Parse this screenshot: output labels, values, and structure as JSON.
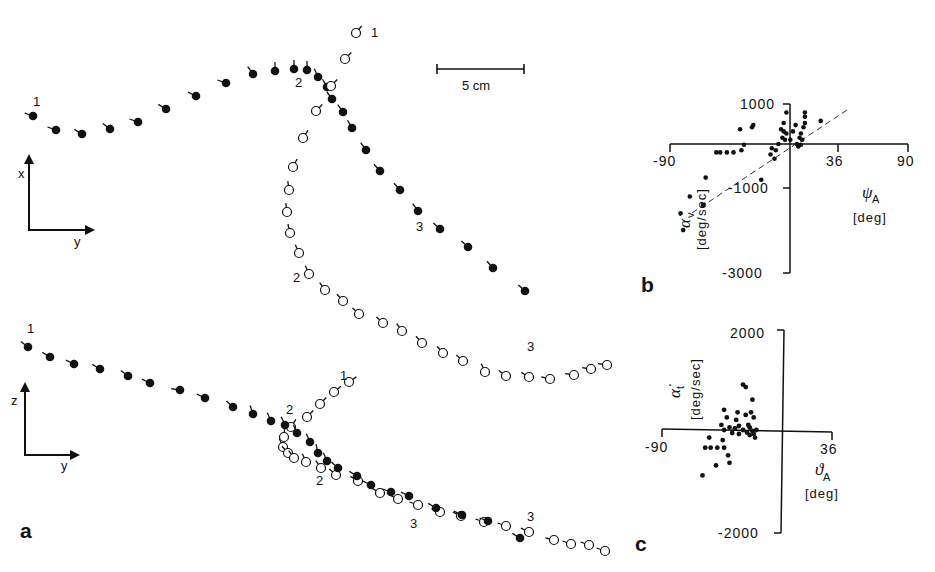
{
  "figure": {
    "panels": {
      "a": "a",
      "b": "b",
      "c": "c"
    },
    "scale_bar": {
      "label": "5 cm",
      "x1": 437,
      "x2": 524,
      "y": 69
    },
    "top_view": {
      "axes": {
        "vertical": "x",
        "horizontal": "y"
      },
      "filled_track": {
        "labels": [
          {
            "text": "1",
            "x": 33,
            "y": 106
          },
          {
            "text": "2",
            "x": 295,
            "y": 87
          },
          {
            "text": "3",
            "x": 416,
            "y": 231
          }
        ],
        "points": [
          [
            33,
            116,
            -2.8
          ],
          [
            56,
            130,
            -2.8
          ],
          [
            82,
            134,
            -2.6
          ],
          [
            110,
            129,
            -2.5
          ],
          [
            138,
            122,
            -2.8
          ],
          [
            166,
            109,
            -2.6
          ],
          [
            196,
            96,
            -2.7
          ],
          [
            226,
            83,
            -2.8
          ],
          [
            253,
            74,
            -2.2
          ],
          [
            275,
            71,
            -1.57
          ],
          [
            294,
            69,
            -1.57
          ],
          [
            307,
            70,
            -1.57
          ],
          [
            318,
            77,
            -2.0
          ],
          [
            327,
            87,
            -2.1
          ],
          [
            332,
            99,
            -2.2
          ],
          [
            343,
            112,
            -2.2
          ],
          [
            352,
            128,
            -2.1
          ],
          [
            366,
            150,
            -2.2
          ],
          [
            380,
            171,
            -2.3
          ],
          [
            400,
            190,
            -2.3
          ],
          [
            418,
            211,
            -2.2
          ],
          [
            440,
            229,
            -2.4
          ],
          [
            468,
            247,
            -2.4
          ],
          [
            493,
            268,
            -2.3
          ],
          [
            525,
            291,
            -2.4
          ]
        ]
      },
      "open_track": {
        "labels": [
          {
            "text": "1",
            "x": 371,
            "y": 37
          },
          {
            "text": "2",
            "x": 293,
            "y": 282
          },
          {
            "text": "3",
            "x": 527,
            "y": 351
          }
        ],
        "points": [
          [
            356,
            33,
            -0.9
          ],
          [
            345,
            59,
            -0.8
          ],
          [
            331,
            86,
            -0.8
          ],
          [
            316,
            111,
            -0.8
          ],
          [
            303,
            138,
            -1.0
          ],
          [
            293,
            167,
            -1.1
          ],
          [
            289,
            190,
            -1.7
          ],
          [
            287,
            212,
            -1.7
          ],
          [
            290,
            233,
            -1.8
          ],
          [
            299,
            253,
            -2.0
          ],
          [
            309,
            274,
            -2.0
          ],
          [
            325,
            290,
            -2.2
          ],
          [
            343,
            301,
            -2.3
          ],
          [
            359,
            314,
            -2.4
          ],
          [
            383,
            323,
            -2.4
          ],
          [
            402,
            331,
            -2.2
          ],
          [
            422,
            343,
            -2.3
          ],
          [
            443,
            353,
            -2.3
          ],
          [
            463,
            361,
            -2.4
          ],
          [
            485,
            372,
            -2.0
          ],
          [
            506,
            376,
            -2.5
          ],
          [
            529,
            377,
            -2.6
          ],
          [
            550,
            379,
            -2.9
          ],
          [
            574,
            375,
            -3.0
          ],
          [
            591,
            369,
            -3.0
          ],
          [
            607,
            365,
            -3.0
          ]
        ]
      }
    },
    "side_view": {
      "axes": {
        "vertical": "z",
        "horizontal": "y"
      },
      "filled_track": {
        "labels": [
          {
            "text": "1",
            "x": 27,
            "y": 333
          },
          {
            "text": "2",
            "x": 286,
            "y": 414
          },
          {
            "text": "3",
            "x": 410,
            "y": 528
          }
        ],
        "points": [
          [
            28,
            347,
            -2.5
          ],
          [
            50,
            357,
            -2.6
          ],
          [
            74,
            364,
            -2.7
          ],
          [
            100,
            369,
            -2.6
          ],
          [
            128,
            376,
            -2.5
          ],
          [
            150,
            383,
            -2.7
          ],
          [
            180,
            390,
            -3.0
          ],
          [
            205,
            398,
            -2.7
          ],
          [
            233,
            407,
            -2.4
          ],
          [
            253,
            414,
            -1.9
          ],
          [
            271,
            421,
            -2.0
          ],
          [
            285,
            425,
            -2.0
          ],
          [
            297,
            433,
            -2.0
          ],
          [
            310,
            442,
            -2.0
          ],
          [
            318,
            453,
            -1.8
          ],
          [
            327,
            461,
            -2.0
          ],
          [
            338,
            468,
            -2.4
          ],
          [
            357,
            476,
            -2.6
          ],
          [
            371,
            485,
            -2.7
          ],
          [
            391,
            492,
            -2.8
          ],
          [
            409,
            496,
            -2.7
          ],
          [
            436,
            508,
            -2.6
          ],
          [
            462,
            515,
            -2.7
          ],
          [
            488,
            521,
            -2.8
          ],
          [
            520,
            538,
            -2.6
          ]
        ]
      },
      "open_track": {
        "labels": [
          {
            "text": "1",
            "x": 340,
            "y": 380
          },
          {
            "text": "2",
            "x": 316,
            "y": 485
          },
          {
            "text": "3",
            "x": 527,
            "y": 521
          }
        ],
        "points": [
          [
            349,
            382,
            -0.6
          ],
          [
            334,
            392,
            -0.7
          ],
          [
            320,
            404,
            -0.8
          ],
          [
            307,
            417,
            -0.8
          ],
          [
            291,
            427,
            -1.0
          ],
          [
            284,
            437,
            -1.5
          ],
          [
            283,
            447,
            -2.0
          ],
          [
            288,
            453,
            -2.3
          ],
          [
            294,
            458,
            -2.2
          ],
          [
            306,
            462,
            -2.0
          ],
          [
            321,
            468,
            -2.2
          ],
          [
            336,
            475,
            -2.4
          ],
          [
            358,
            481,
            -2.6
          ],
          [
            380,
            493,
            -2.6
          ],
          [
            398,
            499,
            -2.7
          ],
          [
            418,
            505,
            -2.8
          ],
          [
            440,
            512,
            -2.8
          ],
          [
            461,
            516,
            -2.7
          ],
          [
            484,
            522,
            -2.8
          ],
          [
            506,
            526,
            -2.8
          ],
          [
            529,
            532,
            -2.7
          ],
          [
            554,
            540,
            -2.9
          ],
          [
            571,
            544,
            -2.8
          ],
          [
            589,
            545,
            -2.8
          ],
          [
            605,
            551,
            -2.8
          ]
        ]
      }
    }
  },
  "chart_data": [
    {
      "type": "scatter",
      "panel": "b",
      "title": "",
      "xlabel": "ψ_A [deg]",
      "ylabel": "α̇_v [deg/sec]",
      "x_ticks": [
        "-90",
        "36",
        "90"
      ],
      "y_ticks": [
        "1000",
        "-1000",
        "-3000"
      ],
      "xlim": [
        -90,
        90
      ],
      "ylim": [
        -3000,
        1000
      ],
      "grid": false,
      "regression_line": {
        "style": "dashed",
        "from": [
          -70,
          -1500
        ],
        "to": [
          40,
          650
        ]
      },
      "points": [
        [
          -2,
          750
        ],
        [
          -4,
          500
        ],
        [
          12,
          500
        ],
        [
          12,
          650
        ],
        [
          12,
          750
        ],
        [
          24,
          550
        ],
        [
          5,
          450
        ],
        [
          -27,
          450
        ],
        [
          -28,
          400
        ],
        [
          -37,
          350
        ],
        [
          -6,
          350
        ],
        [
          -4,
          300
        ],
        [
          -2,
          250
        ],
        [
          3,
          300
        ],
        [
          11,
          400
        ],
        [
          9,
          250
        ],
        [
          -5,
          150
        ],
        [
          -3,
          100
        ],
        [
          1,
          100
        ],
        [
          8,
          150
        ],
        [
          10,
          100
        ],
        [
          -8,
          0
        ],
        [
          6,
          0
        ],
        [
          9,
          -20
        ],
        [
          7,
          -60
        ],
        [
          -34,
          -20
        ],
        [
          -36,
          -150
        ],
        [
          -47,
          -200
        ],
        [
          -42,
          -200
        ],
        [
          -55,
          -200
        ],
        [
          -52,
          -200
        ],
        [
          -10,
          -150
        ],
        [
          -11,
          -350
        ],
        [
          -14,
          -250
        ],
        [
          -13,
          -100
        ],
        [
          -21,
          -850
        ],
        [
          -63,
          -800
        ],
        [
          -75,
          -1250
        ],
        [
          -65,
          -1450
        ],
        [
          -82,
          -1650
        ],
        [
          -80,
          -2050
        ]
      ]
    },
    {
      "type": "scatter",
      "panel": "c",
      "title": "",
      "xlabel": "ϑ_A [deg]",
      "ylabel": "α̇_t [deg/sec]",
      "x_ticks": [
        "-90",
        "36"
      ],
      "y_ticks": [
        "2000",
        "-2000"
      ],
      "xlim": [
        -90,
        36
      ],
      "ylim": [
        -2000,
        2000
      ],
      "grid": false,
      "points": [
        [
          -30,
          900
        ],
        [
          -28,
          850
        ],
        [
          -23,
          600
        ],
        [
          -44,
          400
        ],
        [
          -42,
          250
        ],
        [
          -34,
          350
        ],
        [
          -35,
          200
        ],
        [
          -28,
          300
        ],
        [
          -24,
          350
        ],
        [
          -22,
          250
        ],
        [
          -46,
          100
        ],
        [
          -44,
          0
        ],
        [
          -40,
          50
        ],
        [
          -36,
          30
        ],
        [
          -33,
          80
        ],
        [
          -30,
          0
        ],
        [
          -27,
          -50
        ],
        [
          -25,
          50
        ],
        [
          -23,
          -20
        ],
        [
          -22,
          -80
        ],
        [
          -20,
          0
        ],
        [
          -26,
          100
        ],
        [
          -33,
          -80
        ],
        [
          -38,
          -60
        ],
        [
          -55,
          -150
        ],
        [
          -58,
          -350
        ],
        [
          -54,
          -350
        ],
        [
          -49,
          -350
        ],
        [
          -44,
          -350
        ],
        [
          -45,
          -200
        ],
        [
          -41,
          -500
        ],
        [
          -40,
          -650
        ],
        [
          -50,
          -700
        ],
        [
          -60,
          -900
        ],
        [
          -21,
          -150
        ],
        [
          -25,
          -100
        ]
      ]
    }
  ]
}
